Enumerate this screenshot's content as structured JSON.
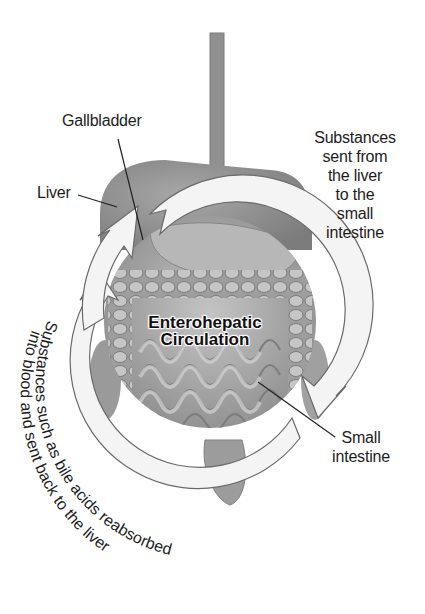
{
  "diagram": {
    "title_line1": "Enterohepatic",
    "title_line2": "Circulation",
    "labels": {
      "gallbladder": "Gallbladder",
      "liver": "Liver",
      "small_intestine_line1": "Small",
      "small_intestine_line2": "intestine"
    },
    "flows": {
      "to_intestine": [
        "Substances",
        "sent from",
        "the liver",
        "to the",
        "small",
        "intestine"
      ],
      "back_to_liver_line1": "Substances such as bile acids reabsorbed",
      "back_to_liver_line2": "into blood and sent back to the liver"
    },
    "colors": {
      "organ_gray": "#8e8e8e",
      "organ_light": "#b9b9b9",
      "arrow_fill": "#f4f4f4",
      "arrow_stroke": "#6a6a6a",
      "text": "#1c1c1c"
    }
  }
}
